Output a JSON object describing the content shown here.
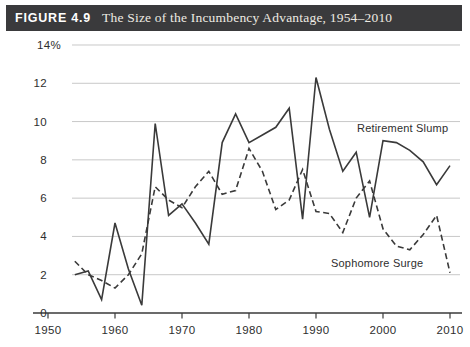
{
  "figure": {
    "label": "FIGURE 4.9",
    "title": "The Size of the Incumbency Advantage, 1954–2010",
    "header_bg": "#3a3a3c",
    "header_label_color": "#ffffff",
    "header_title_color": "#eeebe3"
  },
  "colors": {
    "line": "#3a3a3a",
    "gridline": "#c8c8c8",
    "axis": "#3a3a3a",
    "tick_label": "#2e2e2e"
  },
  "chart_data": {
    "type": "line",
    "title": "The Size of the Incumbency Advantage, 1954–2010",
    "xlabel": "",
    "ylabel": "",
    "xlim": [
      1950,
      2012
    ],
    "ylim": [
      0,
      14
    ],
    "grid": "horizontal",
    "x_tick_labels": [
      "1950",
      "1960",
      "1970",
      "1980",
      "1990",
      "2000",
      "2010"
    ],
    "x_tick_years": [
      1950,
      1960,
      1970,
      1980,
      1990,
      2000,
      2010
    ],
    "y_tick_labels": [
      "14%",
      "12",
      "10",
      "8",
      "6",
      "4",
      "2",
      "0"
    ],
    "y_tick_values": [
      14,
      12,
      10,
      8,
      6,
      4,
      2,
      0
    ],
    "x": [
      1954,
      1956,
      1958,
      1960,
      1962,
      1964,
      1966,
      1968,
      1970,
      1972,
      1974,
      1976,
      1978,
      1980,
      1982,
      1984,
      1986,
      1988,
      1990,
      1992,
      1994,
      1996,
      1998,
      2000,
      2002,
      2004,
      2006,
      2008,
      2010
    ],
    "series": [
      {
        "name": "Retirement Slump",
        "style": "solid",
        "values": [
          2.0,
          2.2,
          0.7,
          4.7,
          2.3,
          0.4,
          9.9,
          5.1,
          5.7,
          4.7,
          3.6,
          8.9,
          10.4,
          8.9,
          9.3,
          9.7,
          10.7,
          4.9,
          12.3,
          9.6,
          7.4,
          8.4,
          5.0,
          9.0,
          8.9,
          8.5,
          7.9,
          6.7,
          7.7
        ]
      },
      {
        "name": "Sophomore Surge",
        "style": "dashed",
        "values": [
          2.7,
          2.0,
          1.7,
          1.3,
          2.0,
          3.1,
          6.6,
          5.9,
          5.5,
          6.6,
          7.4,
          6.2,
          6.4,
          8.6,
          7.4,
          5.4,
          5.9,
          7.5,
          5.3,
          5.2,
          4.2,
          6.0,
          6.9,
          4.4,
          3.5,
          3.3,
          4.1,
          5.1,
          2.1
        ]
      }
    ],
    "annotations": [
      {
        "text": "Retirement Slump",
        "series": "Retirement Slump"
      },
      {
        "text": "Sophomore Surge",
        "series": "Sophomore Surge"
      }
    ],
    "legend_position": "inline-annotations"
  }
}
